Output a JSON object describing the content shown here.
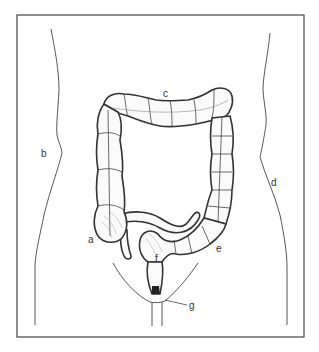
{
  "figure": {
    "frame": {
      "x": 17,
      "y": 15,
      "width": 287,
      "height": 322,
      "stroke": "#444444"
    },
    "labels": [
      {
        "id": "a",
        "text": "a",
        "x": 88,
        "y": 243
      },
      {
        "id": "b",
        "text": "b",
        "x": 41,
        "y": 157
      },
      {
        "id": "c",
        "text": "c",
        "x": 163,
        "y": 97
      },
      {
        "id": "d",
        "text": "d",
        "x": 271,
        "y": 186
      },
      {
        "id": "e",
        "text": "e",
        "x": 216,
        "y": 252
      },
      {
        "id": "f",
        "text": "f",
        "x": 155,
        "y": 262
      },
      {
        "id": "g",
        "text": "g",
        "x": 189,
        "y": 309
      }
    ],
    "colors": {
      "line": "#333333",
      "fill": "#fafafa",
      "background": "#ffffff"
    }
  }
}
